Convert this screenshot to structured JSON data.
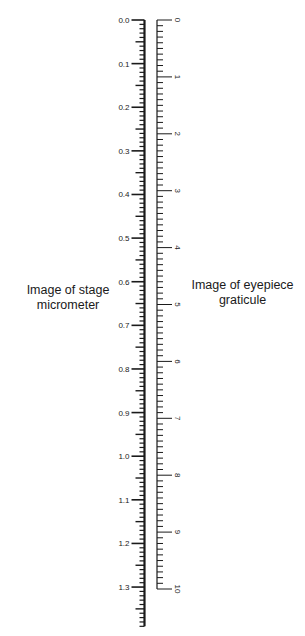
{
  "captions": {
    "stage": "Image of stage micrometer",
    "eyepiece": "Image of eyepiece graticule"
  },
  "stage_scale": {
    "labels": [
      "0.0",
      "0.1",
      "0.2",
      "0.3",
      "0.4",
      "0.5",
      "0.6",
      "0.7",
      "0.8",
      "0.9",
      "1.0",
      "1.1",
      "1.2",
      "1.3"
    ],
    "start": 0.0,
    "end": 1.39,
    "minor_step": 0.01,
    "medium_step": 0.05,
    "major_step": 0.1,
    "y_at_zero": 20,
    "px_per_unit": 436.2,
    "spine_x": 144.5
  },
  "eyepiece_scale": {
    "labels": [
      "0",
      "1",
      "2",
      "3",
      "4",
      "5",
      "6",
      "7",
      "8",
      "9",
      "10"
    ],
    "start": 0,
    "end": 10,
    "minor_step": 0.1,
    "major_step": 1,
    "y_at_zero": 20,
    "px_per_unit": 56.9,
    "spine_x": 157
  },
  "colors": {
    "ink": "#1a1a1a",
    "background": "#ffffff"
  }
}
